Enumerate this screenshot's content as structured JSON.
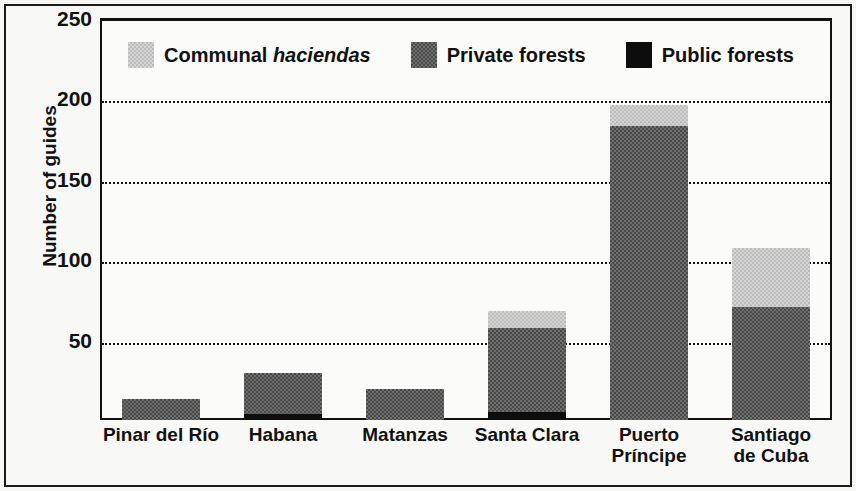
{
  "chart_data": {
    "type": "bar",
    "subtype": "stacked-vertical",
    "title": "",
    "xlabel": "",
    "ylabel": "Number of guides",
    "ylim": [
      0,
      250
    ],
    "ytick_labels": [
      "50",
      "100",
      "150",
      "200",
      "250"
    ],
    "yticks": [
      50,
      100,
      150,
      200,
      250
    ],
    "grid": "horizontal-dotted",
    "legend_position": "inside-top-left",
    "categories": [
      "Pinar del Río",
      "Habana",
      "Matanzas",
      "Santa Clara",
      "Puerto Príncipe",
      "Santiago de Cuba"
    ],
    "category_lines": [
      [
        "Pinar del Río"
      ],
      [
        "Habana"
      ],
      [
        "Matanzas"
      ],
      [
        "Santa Clara"
      ],
      [
        "Puerto",
        "Príncipe"
      ],
      [
        "Santiago",
        "de Cuba"
      ]
    ],
    "series": [
      {
        "name": "Public forests",
        "color": "#0d0d0d",
        "values": [
          0,
          4,
          0,
          5,
          0,
          0
        ]
      },
      {
        "name": "Private forests",
        "color": "#6f6f6f",
        "values": [
          13,
          25,
          19,
          52,
          183,
          70
        ]
      },
      {
        "name": "Communal haciendas",
        "color": "#d5d5d5",
        "values": [
          0,
          0,
          0,
          11,
          13,
          37
        ]
      }
    ],
    "totals": [
      13,
      29,
      19,
      68,
      196,
      107
    ]
  },
  "legend": {
    "items": [
      {
        "label_pre": "Communal ",
        "label_em": "haciendas",
        "swatch": "communal-swatch"
      },
      {
        "label_pre": "Private forests",
        "label_em": "",
        "swatch": "private-swatch"
      },
      {
        "label_pre": "Public forests",
        "label_em": "",
        "swatch": "public-swatch"
      }
    ]
  },
  "axis": {
    "y_title": "Number of guides"
  }
}
